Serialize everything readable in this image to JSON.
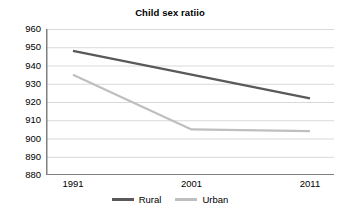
{
  "chart_data": {
    "type": "line",
    "title": "Child sex ratiio",
    "xlabel": "",
    "ylabel": "",
    "categories": [
      "1991",
      "2001",
      "2011"
    ],
    "x": [
      1991,
      2001,
      2011
    ],
    "series": [
      {
        "name": "Rural",
        "values": [
          948,
          935,
          922
        ],
        "color": "#595959"
      },
      {
        "name": "Urban",
        "values": [
          935,
          905,
          904
        ],
        "color": "#bfbfbf"
      }
    ],
    "ylim": [
      880,
      960
    ],
    "ytick_step": 10,
    "yticks": [
      960,
      950,
      940,
      930,
      920,
      910,
      900,
      890,
      880
    ],
    "ytick_labels": [
      "960",
      "950",
      "940",
      "930",
      "920",
      "910",
      "900",
      "890",
      "880"
    ],
    "grid": true,
    "grid_axis": "y",
    "grid_color": "#d9d9d9",
    "axis_color": "#808080",
    "legend_position": "bottom",
    "background": "#ffffff"
  },
  "axes": {
    "y_labels": [
      "960",
      "950",
      "940",
      "930",
      "920",
      "910",
      "900",
      "890",
      "880"
    ],
    "x_labels": [
      "1991",
      "2001",
      "2011"
    ]
  },
  "legend": {
    "items": [
      {
        "label": "Rural",
        "color": "#595959"
      },
      {
        "label": "Urban",
        "color": "#bfbfbf"
      }
    ]
  }
}
